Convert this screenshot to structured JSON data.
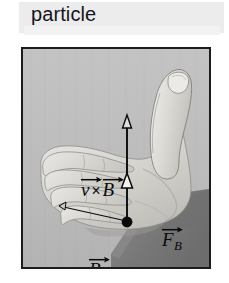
{
  "caption": {
    "text": "particle"
  },
  "figure": {
    "name": "right-hand-rule-photo",
    "border_color": "#1b1c1e",
    "background_color": "#b9b9b9",
    "skin_color": "#d8d6d2",
    "sleeve_color": "#7e7e7e",
    "annotation_color": "#0a0a0c"
  },
  "annotations": [
    {
      "name": "v-cross-b-label",
      "symbol_1": "v",
      "operator": "×",
      "symbol_2": "B",
      "meaning": "v vector cross B vector",
      "direction": "up along thumb"
    },
    {
      "name": "magnetic-force-label",
      "symbol": "F",
      "subscript": "B",
      "meaning": "magnetic force vector",
      "direction": "up along thumb"
    },
    {
      "name": "b-field-label",
      "symbol": "B",
      "meaning": "magnetic field vector",
      "direction": "right, along curled fingers"
    }
  ],
  "vectors": {
    "vertical_arrow": {
      "name": "thumb-direction-arrow",
      "from": "origin-dot",
      "to": "thumb-tip",
      "head_style": "hollow triangle"
    },
    "mid_arrowhead": {
      "name": "force-arrowhead",
      "style": "hollow triangle"
    },
    "horizontal_arrow": {
      "name": "b-field-arrow",
      "direction": "right"
    },
    "origin_dot": {
      "name": "origin-point",
      "color": "#0a0a0c"
    }
  }
}
